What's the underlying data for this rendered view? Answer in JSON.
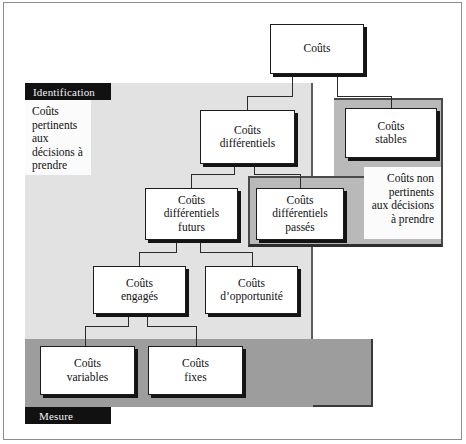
{
  "diagram": {
    "language": "fr",
    "zones": {
      "identification": {
        "tab_label": "Identification",
        "caption": "Coûts pertinents aux décisions à prendre",
        "caption_lines": [
          "Coûts",
          "pertinents",
          "aux",
          "décisions",
          "à prendre"
        ],
        "fill_color": "#e2e2e2"
      },
      "mesure": {
        "tab_label": "Mesure",
        "fill_color": "#9d9d9d"
      },
      "non_pertinents": {
        "caption": "Coûts non pertinents aux décisions à prendre",
        "caption_lines": [
          "Coûts",
          "non pertinents",
          "aux",
          "décisions",
          "à prendre"
        ],
        "fill_color": "#b9b9b9"
      }
    },
    "nodes": {
      "couts": {
        "lines": [
          "Coûts"
        ]
      },
      "differentiels": {
        "lines": [
          "Coûts",
          "différentiels"
        ]
      },
      "stables": {
        "lines": [
          "Coûts",
          "stables"
        ]
      },
      "diff_futurs": {
        "lines": [
          "Coûts",
          "différentiels",
          "futurs"
        ]
      },
      "diff_passes": {
        "lines": [
          "Coûts",
          "différentiels",
          "passés"
        ]
      },
      "engages": {
        "lines": [
          "Coûts",
          "engagés"
        ]
      },
      "opportunite": {
        "lines": [
          "Coûts",
          "d’opportunité"
        ]
      },
      "variables": {
        "lines": [
          "Coûts",
          "variables"
        ]
      },
      "fixes": {
        "lines": [
          "Coûts",
          "fixes"
        ]
      }
    },
    "edges": [
      {
        "from": "couts",
        "to": "differentiels"
      },
      {
        "from": "couts",
        "to": "stables"
      },
      {
        "from": "differentiels",
        "to": "diff_futurs"
      },
      {
        "from": "differentiels",
        "to": "diff_passes"
      },
      {
        "from": "diff_futurs",
        "to": "engages"
      },
      {
        "from": "diff_futurs",
        "to": "opportunite"
      },
      {
        "from": "engages",
        "to": "variables"
      },
      {
        "from": "engages",
        "to": "fixes"
      }
    ],
    "colors": {
      "node_fill": "#ffffff",
      "node_border": "#1c1c1c",
      "shadow": "#141414",
      "tab_bg": "#111111",
      "tab_text": "#f2f2f2",
      "page_bg": "#ffffff"
    }
  }
}
